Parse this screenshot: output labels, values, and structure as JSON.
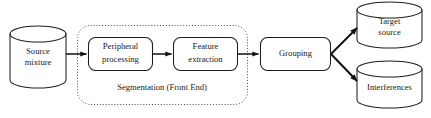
{
  "diagram": {
    "background_color": "#ffffff",
    "stroke_color": "#1d1d1d",
    "nodes": [
      {
        "id": "source-mixture",
        "label_line1": "Source",
        "label_line2": "mixture",
        "shape": "cylinder"
      },
      {
        "id": "peripheral-processing",
        "label_line1": "Peripheral",
        "label_line2": "processing",
        "shape": "rounded-rect"
      },
      {
        "id": "feature-extraction",
        "label_line1": "Feature",
        "label_line2": "extraction",
        "shape": "rounded-rect"
      },
      {
        "id": "grouping",
        "label_line1": "Grouping",
        "label_line2": "",
        "shape": "rounded-rect"
      },
      {
        "id": "target-source",
        "label_line1": "Target",
        "label_line2": "source",
        "shape": "cylinder"
      },
      {
        "id": "interferences",
        "label_line1": "Interferences",
        "label_line2": "",
        "shape": "cylinder"
      }
    ],
    "group": {
      "id": "segmentation-region",
      "label": "Segmentation (Front End)",
      "border_style": "dotted"
    },
    "edges": [
      {
        "id": "edge-source-to-peripheral",
        "from": "source-mixture",
        "to": "peripheral-processing"
      },
      {
        "id": "edge-peripheral-to-feature",
        "from": "peripheral-processing",
        "to": "feature-extraction"
      },
      {
        "id": "edge-feature-to-grouping",
        "from": "feature-extraction",
        "to": "grouping"
      },
      {
        "id": "edge-grouping-to-target",
        "from": "grouping",
        "to": "target-source"
      },
      {
        "id": "edge-grouping-to-interferences",
        "from": "grouping",
        "to": "interferences"
      }
    ]
  }
}
